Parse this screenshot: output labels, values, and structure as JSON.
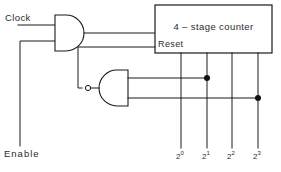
{
  "diagram": {
    "kind": "digital-logic-circuit",
    "background_color": "#ffffff",
    "line_color": "#1a1a1a",
    "text_color": "#2b2b2b"
  },
  "inputs": {
    "clock_label": "Clock",
    "enable_label": "Enable"
  },
  "counter": {
    "title": "4 – stage counter",
    "reset_label": "Reset"
  },
  "gates": {
    "and_gate": {
      "name": "AND",
      "inputs": 2,
      "inverted_output": false
    },
    "nand_gate": {
      "name": "NAND",
      "inputs": 2,
      "inverted_output": true,
      "mirrored": true
    }
  },
  "outputs": [
    {
      "base": "2",
      "exponent": "0"
    },
    {
      "base": "2",
      "exponent": "1"
    },
    {
      "base": "2",
      "exponent": "2"
    },
    {
      "base": "2",
      "exponent": "3"
    }
  ],
  "junctions": [
    {
      "on_output": "2^1"
    },
    {
      "on_output": "2^3"
    }
  ]
}
